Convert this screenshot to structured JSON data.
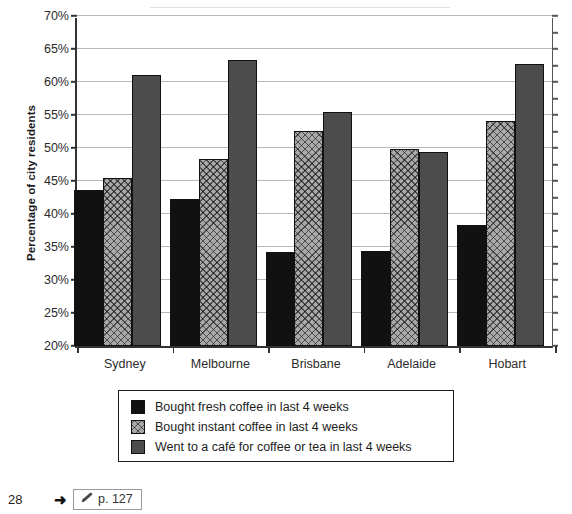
{
  "chart_data": {
    "type": "bar",
    "title": "",
    "xlabel": "",
    "ylabel": "Percentage of city residents",
    "categories": [
      "Sydney",
      "Melbourne",
      "Brisbane",
      "Adelaide",
      "Hobart"
    ],
    "series": [
      {
        "name": "Bought fresh coffee in last 4 weeks",
        "color": "#111111",
        "pattern": "solid-black",
        "values": [
          43.7,
          42.2,
          34.3,
          34.4,
          38.3
        ]
      },
      {
        "name": "Bought instant coffee in last 4 weeks",
        "color": "#a8a8a8",
        "pattern": "crosshatch-gray",
        "values": [
          45.5,
          48.4,
          52.6,
          49.8,
          54.1
        ]
      },
      {
        "name": "Went to a café for coffee or tea in last 4 weeks",
        "color": "#4c4c4c",
        "pattern": "solid-dark-gray",
        "values": [
          61.0,
          63.3,
          55.4,
          49.4,
          62.7
        ]
      }
    ],
    "ylim": [
      20,
      70
    ],
    "ytick_step": 5,
    "ytick_labels": [
      "70%",
      "65%",
      "60%",
      "55%",
      "50%",
      "45%",
      "40%",
      "35%",
      "30%",
      "25%",
      "20%"
    ],
    "ytick_values": [
      70,
      65,
      60,
      55,
      50,
      45,
      40,
      35,
      30,
      25,
      20
    ],
    "grid": true,
    "legend_position": "below-plot"
  },
  "legend": {
    "items": [
      {
        "label": "Bought fresh coffee in last 4 weeks"
      },
      {
        "label": "Bought instant coffee in last 4 weeks"
      },
      {
        "label": "Went to a café for coffee or tea in last 4 weeks"
      }
    ]
  },
  "footer": {
    "page_number": "28",
    "arrow": "➜",
    "reference_text": "p. 127",
    "pencil_icon_name": "pencil-icon"
  },
  "title_strip": {
    "ghost_text": ""
  }
}
